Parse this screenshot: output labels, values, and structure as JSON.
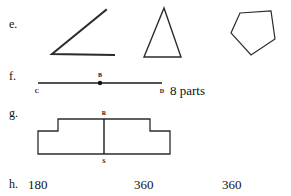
{
  "worksheet": {
    "rows": [
      {
        "label": "e.",
        "figures": [
          {
            "name": "angle-figure",
            "type": "angle"
          },
          {
            "name": "triangle-figure",
            "type": "triangle"
          },
          {
            "name": "pentagon-figure",
            "type": "pentagon"
          }
        ]
      },
      {
        "label": "f.",
        "figures": [
          {
            "name": "line-segment-figure",
            "type": "segment"
          }
        ],
        "answer_text": "8 parts"
      },
      {
        "label": "g.",
        "figures": [
          {
            "name": "stepped-polygon-figure",
            "type": "stepped-polygon"
          }
        ]
      },
      {
        "label": "h.",
        "answers": [
          "180",
          "360",
          "360"
        ]
      }
    ],
    "point_labels": {
      "segment_left": "C",
      "segment_middle": "B",
      "segment_right": "D",
      "step_top": "R",
      "step_bottom": "S"
    },
    "colors": {
      "ink": "#111111",
      "stroke": "#2b2b2b",
      "background": "#ffffff"
    }
  }
}
